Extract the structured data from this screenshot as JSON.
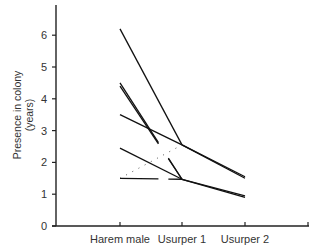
{
  "chart_data": {
    "type": "line",
    "title": "",
    "xlabel": "",
    "ylabel": "Presence in colony (years)",
    "ylabel_lines": [
      "Presence in colony",
      "(years)"
    ],
    "categories": [
      "Harem male",
      "Usurper 1",
      "Usurper 2"
    ],
    "ylim": [
      0,
      6.8
    ],
    "yticks": [
      0,
      1,
      2,
      3,
      4,
      5,
      6
    ],
    "grid": false,
    "legend": null,
    "series": [
      {
        "name": "colony A",
        "values": [
          6.2,
          2.55,
          1.5
        ],
        "style": "solid"
      },
      {
        "name": "colony B",
        "values": [
          4.5,
          1.47,
          null
        ],
        "style": "solid-broken"
      },
      {
        "name": "colony C",
        "values": [
          4.4,
          1.47,
          null
        ],
        "style": "solid-broken"
      },
      {
        "name": "colony D",
        "values": [
          3.5,
          2.55,
          1.55
        ],
        "style": "solid"
      },
      {
        "name": "colony E",
        "values": [
          2.45,
          1.47,
          0.9
        ],
        "style": "solid"
      },
      {
        "name": "colony F",
        "values": [
          1.5,
          2.55,
          null
        ],
        "style": "dotted"
      },
      {
        "name": "colony G",
        "values": [
          1.5,
          1.47,
          0.95
        ],
        "style": "solid-broken"
      }
    ]
  },
  "axis": {
    "ytick_labels": [
      "0",
      "1",
      "2",
      "3",
      "4",
      "5",
      "6"
    ],
    "xtick_labels": [
      "Harem male",
      "Usurper 1",
      "Usurper 2"
    ]
  }
}
